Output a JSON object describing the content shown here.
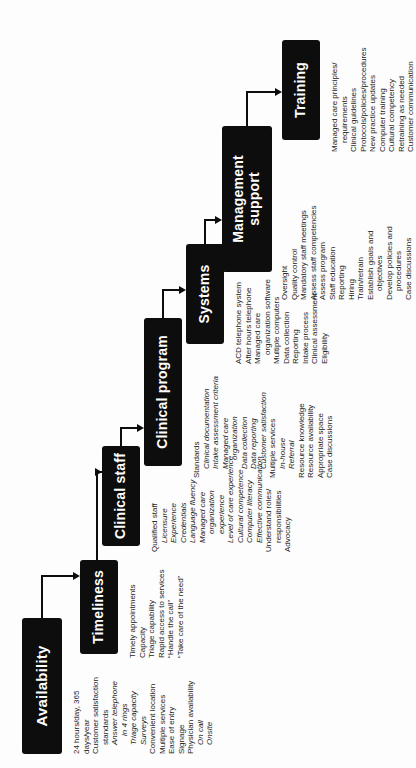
{
  "colors": {
    "box_background": "#0d0d0d",
    "box_text": "#ffffff",
    "body_text": "#1c1c1c",
    "connector_line": "#0d0d0d",
    "page_background": "#fdfdfd"
  },
  "categories": [
    {
      "id": "availability",
      "label": "Availability",
      "items": [
        {
          "text": "24 hours/day, 365",
          "indent": 0,
          "italic": false
        },
        {
          "text": "days/year",
          "indent": 0,
          "italic": false
        },
        {
          "text": "Customer satisfaction",
          "indent": 0,
          "italic": false
        },
        {
          "text": "standards",
          "indent": 1,
          "italic": false
        },
        {
          "text": "Answer telephone",
          "indent": 1,
          "italic": true
        },
        {
          "text": "in 4 rings",
          "indent": 2,
          "italic": true
        },
        {
          "text": "Triage capacity",
          "indent": 1,
          "italic": true
        },
        {
          "text": "Surveys",
          "indent": 1,
          "italic": true
        },
        {
          "text": "Convenient location",
          "indent": 0,
          "italic": false
        },
        {
          "text": "Multiple services",
          "indent": 0,
          "italic": false
        },
        {
          "text": "Ease of entry",
          "indent": 0,
          "italic": false
        },
        {
          "text": "Signage",
          "indent": 0,
          "italic": false
        },
        {
          "text": "Physician availability",
          "indent": 0,
          "italic": false
        },
        {
          "text": "On call",
          "indent": 1,
          "italic": true
        },
        {
          "text": "Onsite",
          "indent": 1,
          "italic": true
        }
      ]
    },
    {
      "id": "timeliness",
      "label": "Timeliness",
      "items": [
        {
          "text": "Timely appointments",
          "indent": 0,
          "italic": false
        },
        {
          "text": "Capacity",
          "indent": 0,
          "italic": false
        },
        {
          "text": "Triage capability",
          "indent": 0,
          "italic": false
        },
        {
          "text": "Rapid access to services",
          "indent": 0,
          "italic": false
        },
        {
          "text": "“Handle the call”",
          "indent": 0,
          "italic": false
        },
        {
          "text": "“Take care of the need”",
          "indent": 0,
          "italic": false
        }
      ]
    },
    {
      "id": "clinical-staff",
      "label": "Clinical staff",
      "items": [
        {
          "text": "Qualified staff",
          "indent": 0,
          "italic": false
        },
        {
          "text": "Licensure",
          "indent": 1,
          "italic": true
        },
        {
          "text": "Experience",
          "indent": 1,
          "italic": true
        },
        {
          "text": "Credentials",
          "indent": 1,
          "italic": true
        },
        {
          "text": "Language fluency",
          "indent": 1,
          "italic": true
        },
        {
          "text": "Managed care",
          "indent": 1,
          "italic": true
        },
        {
          "text": "organization",
          "indent": 2,
          "italic": true
        },
        {
          "text": "experience",
          "indent": 2,
          "italic": true
        },
        {
          "text": "Level of care experience",
          "indent": 1,
          "italic": true
        },
        {
          "text": "Cultural competence",
          "indent": 1,
          "italic": true
        },
        {
          "text": "Computer literacy",
          "indent": 1,
          "italic": true
        },
        {
          "text": "Effective communication",
          "indent": 1,
          "italic": true
        },
        {
          "text": "Understand roles/",
          "indent": 0,
          "italic": false
        },
        {
          "text": "responsibilities",
          "indent": 1,
          "italic": false
        },
        {
          "text": "Advocacy",
          "indent": 0,
          "italic": false
        }
      ]
    },
    {
      "id": "clinical-program",
      "label": "Clinical program",
      "items": [
        {
          "text": "Standards",
          "indent": 0,
          "italic": false
        },
        {
          "text": "Clinical documentation",
          "indent": 1,
          "italic": true
        },
        {
          "text": "Intake assessment criteria",
          "indent": 1,
          "italic": true
        },
        {
          "text": "Managed care",
          "indent": 1,
          "italic": true
        },
        {
          "text": "organization",
          "indent": 2,
          "italic": true
        },
        {
          "text": "Data collection",
          "indent": 1,
          "italic": true
        },
        {
          "text": "Data reporting",
          "indent": 1,
          "italic": true
        },
        {
          "text": "Customer satisfaction",
          "indent": 1,
          "italic": true
        },
        {
          "text": "Multiple services",
          "indent": 0,
          "italic": false
        },
        {
          "text": "In-house",
          "indent": 1,
          "italic": true
        },
        {
          "text": "Referral",
          "indent": 1,
          "italic": true
        },
        {
          "text": "Resource knowledge",
          "indent": 0,
          "italic": false
        },
        {
          "text": "Resource availability",
          "indent": 0,
          "italic": false
        },
        {
          "text": "Appropriate space",
          "indent": 0,
          "italic": false
        },
        {
          "text": "Case discussions",
          "indent": 0,
          "italic": false
        }
      ]
    },
    {
      "id": "systems",
      "label": "Systems",
      "items": [
        {
          "text": "ACD telephone system",
          "indent": 0,
          "italic": false
        },
        {
          "text": "After hours telephone",
          "indent": 0,
          "italic": false
        },
        {
          "text": "Managed care",
          "indent": 0,
          "italic": false
        },
        {
          "text": "organization software",
          "indent": 1,
          "italic": false
        },
        {
          "text": "Multiple computers",
          "indent": 0,
          "italic": false
        },
        {
          "text": "Data collection",
          "indent": 0,
          "italic": false
        },
        {
          "text": "Reporting",
          "indent": 0,
          "italic": false
        },
        {
          "text": "Intake process",
          "indent": 0,
          "italic": false
        },
        {
          "text": "Clinical assessment",
          "indent": 0,
          "italic": false
        },
        {
          "text": "Eligibility",
          "indent": 0,
          "italic": false
        }
      ]
    },
    {
      "id": "management-support",
      "label": "Management support",
      "items": [
        {
          "text": "Oversight",
          "indent": 0,
          "italic": false
        },
        {
          "text": "Quality control",
          "indent": 0,
          "italic": false
        },
        {
          "text": "Mandatory staff meetings",
          "indent": 0,
          "italic": false
        },
        {
          "text": "Assess staff competencies",
          "indent": 0,
          "italic": false
        },
        {
          "text": "Assess program",
          "indent": 0,
          "italic": false
        },
        {
          "text": "Staff education",
          "indent": 0,
          "italic": false
        },
        {
          "text": "Reporting",
          "indent": 0,
          "italic": false
        },
        {
          "text": "Hiring",
          "indent": 0,
          "italic": false
        },
        {
          "text": "Train/retrain",
          "indent": 0,
          "italic": false
        },
        {
          "text": "Establish goals and",
          "indent": 0,
          "italic": false
        },
        {
          "text": "objectives",
          "indent": 1,
          "italic": false
        },
        {
          "text": "Develop policies and",
          "indent": 0,
          "italic": false
        },
        {
          "text": "procedures",
          "indent": 1,
          "italic": false
        },
        {
          "text": "Case discussions",
          "indent": 0,
          "italic": false
        }
      ]
    },
    {
      "id": "training",
      "label": "Training",
      "items": [
        {
          "text": "Managed care principles/",
          "indent": 0,
          "italic": false
        },
        {
          "text": "requirements",
          "indent": 1,
          "italic": false
        },
        {
          "text": "Clinical guidelines",
          "indent": 0,
          "italic": false
        },
        {
          "text": "Protocols/policies/procedures",
          "indent": 0,
          "italic": false
        },
        {
          "text": "New practice updates",
          "indent": 0,
          "italic": false
        },
        {
          "text": "Computer training",
          "indent": 0,
          "italic": false
        },
        {
          "text": "Cultural competency",
          "indent": 0,
          "italic": false
        },
        {
          "text": "Retraining as needed",
          "indent": 0,
          "italic": false
        },
        {
          "text": "Customer communication",
          "indent": 0,
          "italic": false
        }
      ]
    }
  ]
}
